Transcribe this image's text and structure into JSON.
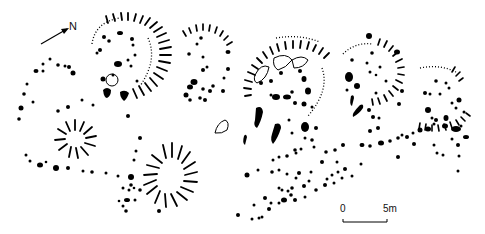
{
  "diagram": {
    "type": "archaeological site plan",
    "north_label": "N",
    "scale": {
      "start": "0",
      "end": "5m"
    },
    "colors": {
      "ink": "#000000",
      "background": "#ffffff"
    },
    "features": [
      {
        "name": "structure-1",
        "kind": "roundhouse with stake-hole rings and radial hachures",
        "cx": 125,
        "cy": 60
      },
      {
        "name": "structure-2",
        "kind": "roundhouse with partial hachured arc",
        "cx": 205,
        "cy": 65
      },
      {
        "name": "structure-3",
        "kind": "roundhouse with hachured arc and pits",
        "cx": 285,
        "cy": 85
      },
      {
        "name": "structure-4",
        "kind": "roundhouse with hachured arc",
        "cx": 375,
        "cy": 85
      },
      {
        "name": "structure-5",
        "kind": "partial hachured arc",
        "cx": 450,
        "cy": 100
      },
      {
        "name": "hut-circle-small",
        "kind": "hachured ring",
        "cx": 75,
        "cy": 138
      },
      {
        "name": "hut-circle-oval",
        "kind": "hachured oval ring",
        "cx": 172,
        "cy": 175
      },
      {
        "name": "post-hole-alignment",
        "kind": "linear spread of post-holes",
        "from": [
          240,
          225
        ],
        "to": [
          475,
          135
        ]
      }
    ]
  }
}
